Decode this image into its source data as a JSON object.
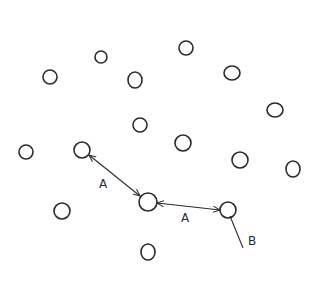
{
  "diagram": {
    "nodes": [
      {
        "id": "n1",
        "cx": 101,
        "cy": 57,
        "rx": 6,
        "ry": 6
      },
      {
        "id": "n2",
        "cx": 186,
        "cy": 48,
        "rx": 7,
        "ry": 7
      },
      {
        "id": "n3",
        "cx": 50,
        "cy": 77,
        "rx": 7,
        "ry": 7
      },
      {
        "id": "n4",
        "cx": 135,
        "cy": 80,
        "rx": 7,
        "ry": 8
      },
      {
        "id": "n5",
        "cx": 232,
        "cy": 73,
        "rx": 8,
        "ry": 7
      },
      {
        "id": "n6",
        "cx": 275,
        "cy": 110,
        "rx": 8,
        "ry": 7
      },
      {
        "id": "n7",
        "cx": 140,
        "cy": 125,
        "rx": 7,
        "ry": 7
      },
      {
        "id": "n8",
        "cx": 26,
        "cy": 152,
        "rx": 7,
        "ry": 7
      },
      {
        "id": "n9",
        "cx": 82,
        "cy": 150,
        "rx": 8,
        "ry": 8
      },
      {
        "id": "n10",
        "cx": 183,
        "cy": 143,
        "rx": 8,
        "ry": 8
      },
      {
        "id": "n11",
        "cx": 240,
        "cy": 160,
        "rx": 8,
        "ry": 8
      },
      {
        "id": "n12",
        "cx": 293,
        "cy": 169,
        "rx": 7,
        "ry": 8
      },
      {
        "id": "n13",
        "cx": 148,
        "cy": 202,
        "rx": 9,
        "ry": 9
      },
      {
        "id": "n14",
        "cx": 62,
        "cy": 211,
        "rx": 8,
        "ry": 8
      },
      {
        "id": "n15",
        "cx": 228,
        "cy": 210,
        "rx": 8,
        "ry": 8
      },
      {
        "id": "n16",
        "cx": 148,
        "cy": 252,
        "rx": 7,
        "ry": 8
      }
    ],
    "edges": [
      {
        "from": "n9",
        "to": "n13",
        "label": "A",
        "type": "double-arrow"
      },
      {
        "from": "n13",
        "to": "n15",
        "label": "A",
        "type": "double-arrow"
      },
      {
        "from": "n15",
        "to": "end",
        "label": "B",
        "type": "line"
      }
    ],
    "labels": {
      "edge_a1": "A",
      "edge_a2": "A",
      "edge_b": "B"
    }
  }
}
